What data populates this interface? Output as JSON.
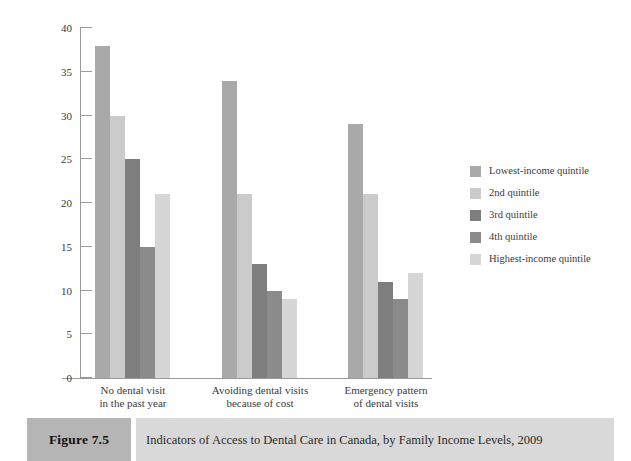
{
  "chart_data": {
    "type": "bar",
    "title": "",
    "xlabel": "",
    "ylabel": "",
    "ylim": [
      0,
      40
    ],
    "ytick_step": 5,
    "yticks": [
      "40",
      "35",
      "30",
      "25",
      "20",
      "15",
      "10",
      "5",
      "0"
    ],
    "grid": false,
    "legend_position": "right",
    "categories": [
      "No dental visit\nin the past year",
      "Avoiding dental visits\nbecause of cost",
      "Emergency pattern\nof dental visits"
    ],
    "category_lines": [
      [
        "No dental visit",
        "in the past year"
      ],
      [
        "Avoiding dental visits",
        "because of cost"
      ],
      [
        "Emergency pattern",
        "of dental visits"
      ]
    ],
    "series": [
      {
        "name": "Lowest-income quintile",
        "color": "#a9a9a9",
        "values": [
          38,
          34,
          29
        ]
      },
      {
        "name": "2nd quintile",
        "color": "#cbcbcb",
        "values": [
          30,
          21,
          21
        ]
      },
      {
        "name": "3rd quintile",
        "color": "#7e7e7e",
        "values": [
          25,
          13,
          11
        ]
      },
      {
        "name": "4th quintile",
        "color": "#8b8b8b",
        "values": [
          15,
          10,
          9
        ]
      },
      {
        "name": "Highest-income quintile",
        "color": "#d6d6d6",
        "values": [
          21,
          9,
          12
        ]
      }
    ]
  },
  "legend": {
    "items": [
      {
        "label": "Lowest-income quintile",
        "color": "#a9a9a9"
      },
      {
        "label": "2nd quintile",
        "color": "#cbcbcb"
      },
      {
        "label": "3rd quintile",
        "color": "#7e7e7e"
      },
      {
        "label": "4th quintile",
        "color": "#8b8b8b"
      },
      {
        "label": "Highest-income quintile",
        "color": "#d6d6d6"
      }
    ]
  },
  "caption": {
    "figure_label": "Figure 7.5",
    "title": "Indicators of Access to Dental Care in Canada, by Family Income Levels, 2009",
    "figure_box_color": "#b5b5b5",
    "title_box_color": "#d9d9d9"
  }
}
